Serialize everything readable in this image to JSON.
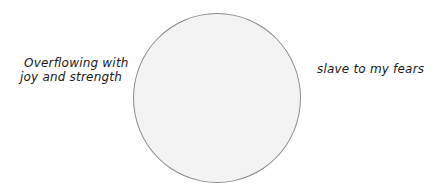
{
  "diagram": {
    "left_label": {
      "line1": "Overflowing with",
      "line2": "joy and strength"
    },
    "right_label": "slave to my fears",
    "circle": {
      "fill": "#f3f3f3",
      "stroke": "#8a8a8a"
    }
  }
}
